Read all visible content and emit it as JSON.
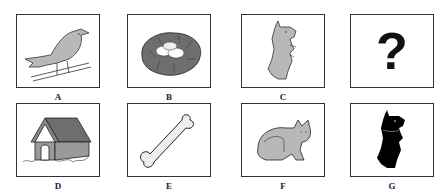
{
  "puzzle": {
    "rows": [
      {
        "cells": [
          {
            "label": "A",
            "icon": "bird-icon",
            "description": "bird on a wire"
          },
          {
            "label": "B",
            "icon": "nest-icon",
            "description": "nest with eggs"
          },
          {
            "label": "C",
            "icon": "dog-icon",
            "description": "dog sitting up (gray)"
          },
          {
            "label": "",
            "icon": "question-mark-icon",
            "symbol": "?",
            "description": "unknown"
          }
        ]
      },
      {
        "cells": [
          {
            "label": "D",
            "icon": "doghouse-icon",
            "description": "dog house"
          },
          {
            "label": "E",
            "icon": "bone-icon",
            "description": "bone"
          },
          {
            "label": "F",
            "icon": "cat-icon",
            "description": "sitting cat"
          },
          {
            "label": "G",
            "icon": "dog-silhouette-icon",
            "description": "black dog silhouette"
          }
        ]
      }
    ]
  },
  "colors": {
    "fill_gray": "#b8b8b8",
    "dark_gray": "#6e6e6e",
    "outline": "#333333",
    "silhouette": "#000000"
  }
}
